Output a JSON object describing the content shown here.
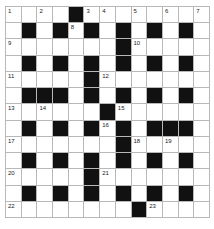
{
  "puzzle": {
    "type": "crossword",
    "rows": 13,
    "cols": 13,
    "colors": {
      "black_cell": "#111111",
      "white_cell": "#ffffff",
      "grid_line": "#b8b8b8"
    },
    "layout": [
      "....#........",
      ".#.#.#.#.#.#.",
      ".......#.....",
      ".#.#.#.#.#.#.",
      ".....#.......",
      ".###.#.#.#.#.",
      "......#......",
      ".#.#.#.#.###.",
      ".......#.....",
      ".#.#.#.#.#.#.",
      ".....#.......",
      ".#.#.#.#.#.#.",
      "........#...."
    ],
    "numbers": [
      {
        "row": 0,
        "col": 0,
        "n": "1"
      },
      {
        "row": 0,
        "col": 2,
        "n": "2"
      },
      {
        "row": 0,
        "col": 5,
        "n": "3"
      },
      {
        "row": 0,
        "col": 6,
        "n": "4"
      },
      {
        "row": 0,
        "col": 8,
        "n": "5"
      },
      {
        "row": 0,
        "col": 10,
        "n": "6"
      },
      {
        "row": 0,
        "col": 12,
        "n": "7"
      },
      {
        "row": 1,
        "col": 4,
        "n": "8"
      },
      {
        "row": 2,
        "col": 0,
        "n": "9"
      },
      {
        "row": 2,
        "col": 8,
        "n": "10"
      },
      {
        "row": 4,
        "col": 0,
        "n": "11"
      },
      {
        "row": 4,
        "col": 6,
        "n": "12"
      },
      {
        "row": 6,
        "col": 0,
        "n": "13"
      },
      {
        "row": 6,
        "col": 2,
        "n": "14"
      },
      {
        "row": 6,
        "col": 7,
        "n": "15"
      },
      {
        "row": 7,
        "col": 6,
        "n": "16"
      },
      {
        "row": 8,
        "col": 0,
        "n": "17"
      },
      {
        "row": 8,
        "col": 8,
        "n": "18"
      },
      {
        "row": 8,
        "col": 10,
        "n": "19"
      },
      {
        "row": 10,
        "col": 0,
        "n": "20"
      },
      {
        "row": 10,
        "col": 6,
        "n": "21"
      },
      {
        "row": 12,
        "col": 0,
        "n": "22"
      },
      {
        "row": 12,
        "col": 9,
        "n": "23"
      }
    ]
  }
}
